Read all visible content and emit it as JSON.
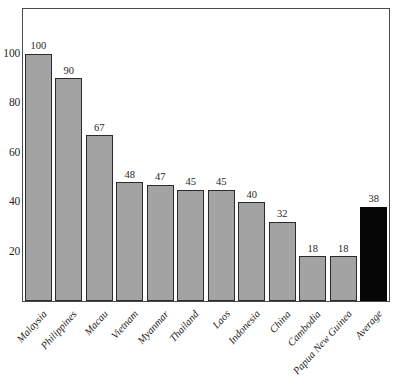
{
  "chart_data": {
    "type": "bar",
    "title": "",
    "subtitle": "",
    "xlabel": "",
    "ylabel": "",
    "ylim": [
      0,
      118
    ],
    "yticks": [
      20,
      40,
      60,
      80,
      100
    ],
    "ytick_labels": [
      "20",
      "40",
      "60",
      "80",
      "100"
    ],
    "grid": false,
    "legend": "none",
    "categories": [
      "Malaysia",
      "Philippines",
      "Macau",
      "Vietnam",
      "Myanmar",
      "Thailand",
      "Laos",
      "Indonesia",
      "China",
      "Cambodia",
      "Papua New Guinea",
      "Average"
    ],
    "values": [
      100,
      90,
      67,
      48,
      47,
      45,
      45,
      40,
      32,
      18,
      18,
      38
    ],
    "value_labels": [
      "100",
      "90",
      "67",
      "48",
      "47",
      "45",
      "45",
      "40",
      "32",
      "18",
      "18",
      "38"
    ],
    "bar_colors": [
      "#a3a3a3",
      "#a3a3a3",
      "#a3a3a3",
      "#a3a3a3",
      "#a3a3a3",
      "#a3a3a3",
      "#a3a3a3",
      "#a3a3a3",
      "#a3a3a3",
      "#a3a3a3",
      "#a3a3a3",
      "#060606"
    ],
    "highlight_index": 11,
    "colors": {
      "bar_fill": "#a3a3a3",
      "bar_edge": "#2b2b2b",
      "highlight_fill": "#060606",
      "axis": "#4a4a4a",
      "text": "#1f1f1f",
      "background": "#ffffff"
    }
  }
}
